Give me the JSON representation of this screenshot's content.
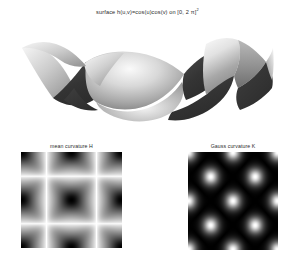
{
  "figure": {
    "title_parts": {
      "prefix": "surface h(u,v)=cos(u)cos(v) on [0, 2",
      "symbol": "π",
      "suffix": "]",
      "exponent": "2"
    },
    "title_full": "surface h(u,v)=cos(u)cos(v) on [0, 2 π]²",
    "background_color": "#ffffff",
    "text_color": "#2a2a2a"
  },
  "surface_plot": {
    "name": "surface-plot",
    "description": "shaded 3D egg-carton surface",
    "colormap": "grayscale",
    "highlight_color": "#f2f2f2",
    "shadow_color": "#3a3a3a",
    "dark_color": "#2e2e2e"
  },
  "panels": [
    {
      "id": "mean",
      "label": "mean curvature H",
      "colormap": "gray-inverted",
      "background_color": "#ffffff",
      "feature_color": "#000000"
    },
    {
      "id": "gauss",
      "label": "Gauss curvature K",
      "colormap": "gray",
      "background_color": "#000000",
      "feature_color": "#ffffff"
    }
  ],
  "chart_data": {
    "type": "heatmap",
    "function": "h(u,v) = cos(u)*cos(v)",
    "domain": {
      "u": [
        0,
        6.283185
      ],
      "v": [
        0,
        6.283185
      ]
    },
    "xlabel": "u",
    "ylabel": "v",
    "grid": false,
    "legend": "none",
    "panels": [
      {
        "name": "surface",
        "type": "surface3d",
        "zlim": [
          -1,
          1
        ],
        "shading": "grayscale-lighting"
      },
      {
        "name": "mean curvature H",
        "type": "heatmap",
        "colormap": "gray",
        "notes": "dark X-shaped diagonals with dark core at center of domain, light at the four lobe centers"
      },
      {
        "name": "Gauss curvature K",
        "type": "heatmap",
        "colormap": "gray",
        "notes": "predominantly black field, bright concentrated spot at domain center with faint diagonal rays"
      }
    ]
  }
}
